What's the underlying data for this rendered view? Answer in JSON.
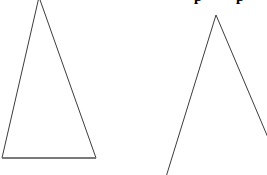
{
  "canvas": {
    "width": 267,
    "height": 175,
    "background": "#ffffff"
  },
  "caption": {
    "text": "p p",
    "note": "bold heading clipped by top edge; only descender stems visible",
    "color": "#000000",
    "fragment_left_x": 196,
    "fragment_right_x": 224,
    "visible_height": 5
  },
  "figures": [
    {
      "name": "closed-triangle",
      "type": "polygon",
      "closed": true,
      "stroke": "#3c3c3c",
      "stroke_width": 1,
      "points": "39,-3 96,158 2,158",
      "vertices": [
        {
          "label": "apex",
          "x": 39,
          "y": -3
        },
        {
          "label": "base-right",
          "x": 96,
          "y": 158
        },
        {
          "label": "base-left",
          "x": 2,
          "y": 158
        }
      ]
    },
    {
      "name": "open-inverted-v",
      "type": "polyline",
      "closed": false,
      "stroke": "#3c3c3c",
      "stroke_width": 1,
      "points": "166,177 216,15 269,140",
      "vertices": [
        {
          "label": "left-leg-end",
          "x": 166,
          "y": 177
        },
        {
          "label": "apex",
          "x": 216,
          "y": 15
        },
        {
          "label": "right-leg-end",
          "x": 269,
          "y": 140
        }
      ]
    }
  ],
  "baseline_accent": {
    "name": "triangle-base-highlight",
    "x1": 2,
    "y1": 158,
    "x2": 96,
    "y2": 158,
    "stroke": "#6e6e6e",
    "stroke_width": 2
  }
}
